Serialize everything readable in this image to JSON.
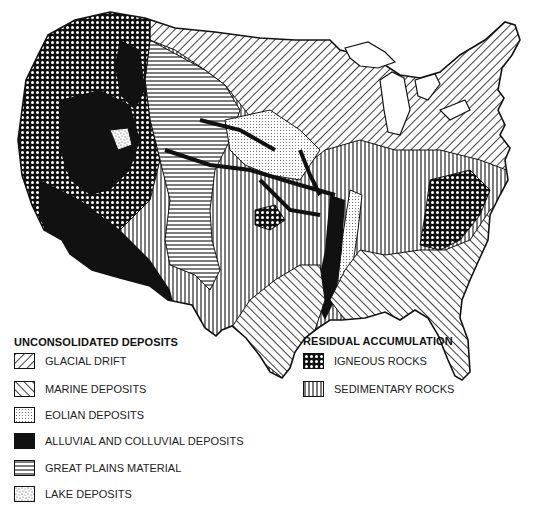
{
  "map": {
    "subject": "Parent materials of soils of the conterminous United States",
    "colors": {
      "ink": "#111111",
      "paper": "#ffffff"
    }
  },
  "legend": {
    "unconsolidated": {
      "heading": "UNCONSOLIDATED DEPOSITS",
      "items": [
        {
          "label": "GLACIAL DRIFT",
          "pattern": "diagonal-lines-forward"
        },
        {
          "label": "MARINE DEPOSITS",
          "pattern": "diagonal-lines-backward"
        },
        {
          "label": "EOLIAN DEPOSITS",
          "pattern": "fine-dots"
        },
        {
          "label": "ALLUVIAL AND COLLUVIAL DEPOSITS",
          "pattern": "solid-black"
        },
        {
          "label": "GREAT PLAINS MATERIAL",
          "pattern": "horizontal-lines"
        },
        {
          "label": "LAKE DEPOSITS",
          "pattern": "stipple"
        }
      ]
    },
    "residual": {
      "heading": "RESIDUAL ACCUMULATION",
      "items": [
        {
          "label": "IGNEOUS ROCKS",
          "pattern": "crosshatch"
        },
        {
          "label": "SEDIMENTARY ROCKS",
          "pattern": "vertical-lines"
        }
      ]
    }
  }
}
